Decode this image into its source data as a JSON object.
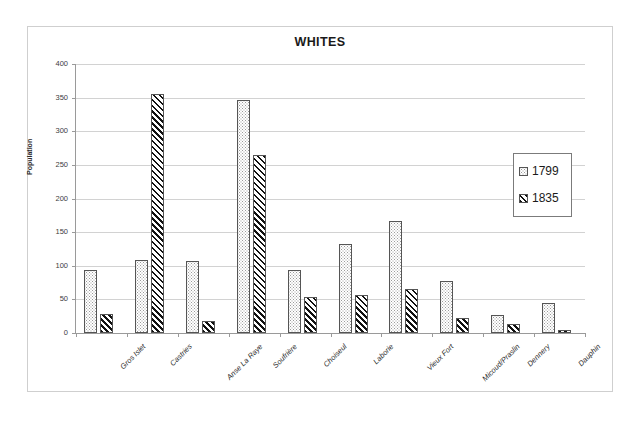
{
  "chart_data": {
    "type": "bar",
    "title": "WHITES",
    "xlabel": "",
    "ylabel": "Population",
    "ylim": [
      0,
      400
    ],
    "yticks": [
      0,
      50,
      100,
      150,
      200,
      250,
      300,
      350,
      400
    ],
    "grid": true,
    "legend_position": "right-inside",
    "categories": [
      "Gros Islet",
      "Castries",
      "Anse La Raye",
      "Soufrière",
      "Choiseul",
      "Laborie",
      "Vieux Fort",
      "Micoud/Praslin",
      "Dennery",
      "Dauphin"
    ],
    "series": [
      {
        "name": "1799",
        "pattern": "dotted",
        "values": [
          94,
          108,
          107,
          347,
          94,
          133,
          166,
          78,
          27,
          44
        ]
      },
      {
        "name": "1835",
        "pattern": "diagonal-hatch",
        "values": [
          29,
          355,
          18,
          265,
          54,
          57,
          66,
          23,
          13,
          5
        ]
      }
    ]
  },
  "legend": {
    "entries": [
      {
        "label": "1799"
      },
      {
        "label": "1835"
      }
    ]
  },
  "colors": {
    "frame_border": "#cfcfcf",
    "gridline": "#d2d2d2",
    "axis_line": "#9a9a9a",
    "bar_outline": "#555555",
    "text": "#1a1a1a"
  }
}
